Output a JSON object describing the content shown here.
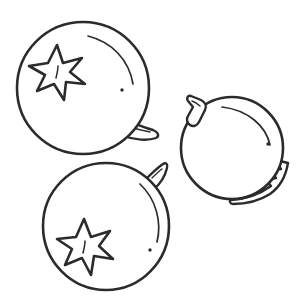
{
  "artwork": {
    "title": "Three Fruits Line Drawing",
    "style": "coloring-book outline",
    "background_color": "#ffffff",
    "stroke_color": "#2b2b2b",
    "fill_color": "#ffffff",
    "canvas": {
      "width": 304,
      "height": 302
    }
  },
  "objects": [
    {
      "id": "fruit-top-left",
      "name": "persimmon-top-left",
      "shape": "round-fruit",
      "center": {
        "x": 83,
        "y": 88
      },
      "radius": 66,
      "parts": {
        "calyx": "six-point-star",
        "calyx_center": {
          "x": 56,
          "y": 72
        },
        "leaf": "pointed-leaf-lower-right",
        "speck": {
          "x": 122,
          "y": 90
        },
        "highlight": "upper-right-arc"
      }
    },
    {
      "id": "fruit-right",
      "name": "persimmon-right",
      "shape": "round-fruit",
      "center": {
        "x": 232,
        "y": 148
      },
      "radius": 51,
      "parts": {
        "stem": "bent-stem-upper-left",
        "leaf": "serrated-leaf-lower-right",
        "speck": {
          "x": 268,
          "y": 144
        },
        "highlight": "upper-right-arc"
      }
    },
    {
      "id": "fruit-bottom-left",
      "name": "persimmon-bottom-left",
      "shape": "round-fruit",
      "center": {
        "x": 106,
        "y": 226
      },
      "radius": 63,
      "parts": {
        "calyx": "six-point-star",
        "calyx_center": {
          "x": 84,
          "y": 247
        },
        "leaf": "pointed-leaf-upper-right",
        "speck": {
          "x": 150,
          "y": 250
        },
        "highlight": "right-arc"
      }
    }
  ],
  "counts": {
    "fruits": 3,
    "star_calyxes": 2,
    "stems": 1,
    "leaves": 3,
    "specks": 3
  }
}
